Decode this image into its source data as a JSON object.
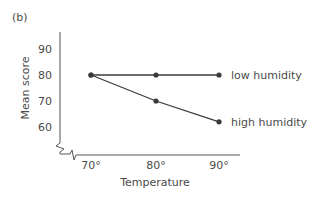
{
  "chart_data": {
    "type": "line",
    "panel_label": "(b)",
    "title": "",
    "xlabel": "Temperature",
    "ylabel": "Mean score",
    "categories": [
      "70°",
      "80°",
      "90°"
    ],
    "x": [
      70,
      80,
      90
    ],
    "yticks": [
      60,
      70,
      80,
      90
    ],
    "ylim": [
      55,
      95
    ],
    "y_axis_break": true,
    "grid": false,
    "legend_position": "inline-right",
    "series": [
      {
        "name": "low humidity",
        "values": [
          80,
          80,
          80
        ]
      },
      {
        "name": "high humidity",
        "values": [
          80,
          70,
          62
        ]
      }
    ]
  },
  "colors": {
    "line": "#3a3a3a",
    "text": "#4a4a4a",
    "axis": "#555555"
  }
}
